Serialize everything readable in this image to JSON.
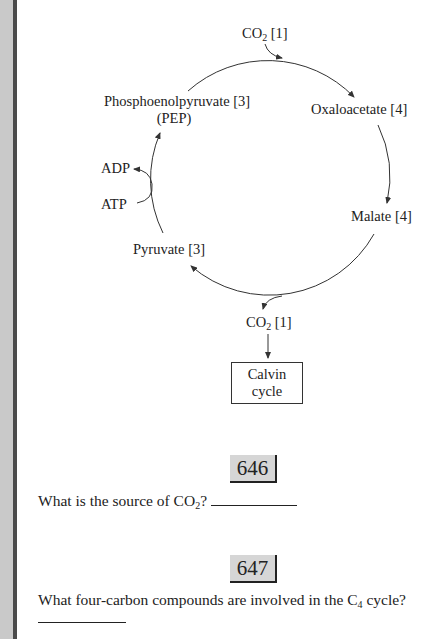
{
  "diagram": {
    "title": "C4 cycle",
    "nodes": {
      "co2_in": {
        "prefix": "CO",
        "sub": "2",
        "suffix": " [1]"
      },
      "pep": {
        "line1": "Phosphoenolpyruvate [3]",
        "line2": "(PEP)"
      },
      "oxaloacetate": "Oxaloacetate [4]",
      "malate": "Malate [4]",
      "pyruvate": "Pyruvate [3]",
      "adp": "ADP",
      "atp": "ATP",
      "co2_out": {
        "prefix": "CO",
        "sub": "2",
        "suffix": " [1]"
      },
      "calvin": {
        "line1": "Calvin",
        "line2": "cycle"
      }
    },
    "colors": {
      "stroke": "#333333",
      "gutter": "#c9c9c9",
      "gutter_bar": "#4a4a4a",
      "badge": "#d6d6d6"
    }
  },
  "questions": [
    {
      "number": "646",
      "text_prefix": "What is the source of CO",
      "text_sub": "2",
      "text_suffix": "? "
    },
    {
      "number": "647",
      "text_prefix": "What four-carbon compounds are involved in the C",
      "text_sub": "4",
      "text_suffix": " cycle?"
    }
  ]
}
